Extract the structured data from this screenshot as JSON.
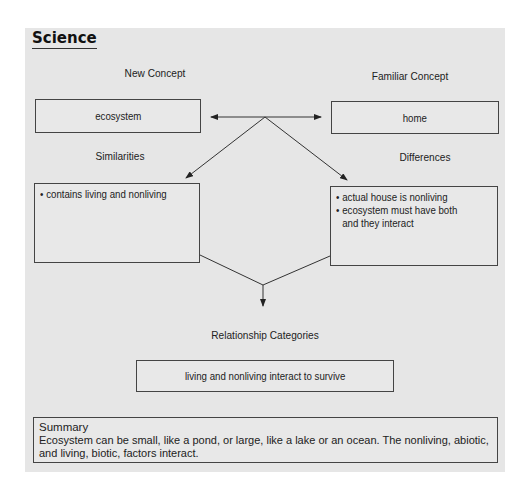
{
  "header": {
    "title": "Science"
  },
  "new_concept": {
    "label": "New Concept",
    "value": "ecosystem"
  },
  "familiar_concept": {
    "label": "Familiar Concept",
    "value": "home"
  },
  "similarities": {
    "label": "Similarities",
    "items": [
      "contains living and nonliving"
    ]
  },
  "differences": {
    "label": "Differences",
    "items": [
      "actual house is nonliving",
      "ecosystem must have both and they interact"
    ]
  },
  "relationship": {
    "label": "Relationship Categories",
    "value": "living and nonliving interact to survive"
  },
  "summary": {
    "title": "Summary",
    "text": "Ecosystem can be small, like a pond, or large, like a lake or an ocean. The nonliving, abiotic, and living, biotic, factors interact."
  },
  "colors": {
    "panel": "#e6e6e6",
    "line": "#444444",
    "text": "#222222"
  }
}
